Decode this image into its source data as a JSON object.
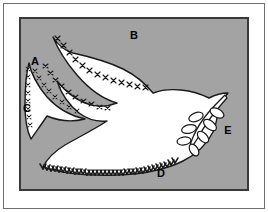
{
  "figure": {
    "panel_background_color": "#a3a3a3",
    "shape_fill_color": "#ffffff",
    "outline_color": "#1a1a1a",
    "frame_color": "#6e6e6e",
    "panel_border_color": "#3a3a3a",
    "label_color": "#000000",
    "labels": [
      {
        "id": "A",
        "text": "A",
        "x": 14,
        "y": 46,
        "target": "upper-left-wing-tip"
      },
      {
        "id": "B",
        "text": "B",
        "x": 113,
        "y": 20,
        "target": "upper-wing-trailing-edge"
      },
      {
        "id": "C",
        "text": "C",
        "x": 6,
        "y": 93,
        "target": "lower-left-wing-tip"
      },
      {
        "id": "D",
        "text": "D",
        "x": 140,
        "y": 158,
        "target": "tail-bottom-edge"
      },
      {
        "id": "E",
        "text": "E",
        "x": 207,
        "y": 115,
        "target": "olive-branch"
      }
    ],
    "annotations": {
      "hatch_style_upper": "x-marks",
      "hatch_style_lower": "sawtooth-zigzag",
      "branch_leaf_count": 7
    }
  }
}
